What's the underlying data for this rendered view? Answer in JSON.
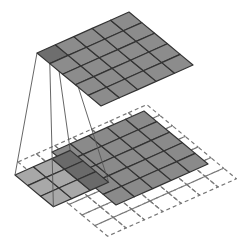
{
  "diagram": {
    "type": "convolution-illustration",
    "colors": {
      "background": "#ffffff",
      "output_cell": "#8c8c8c",
      "output_highlight": "#6e6e6e",
      "input_cell": "#8a8a8a",
      "kernel_cell": "#a8a8a8",
      "overlap_cell": "#6a6a6a",
      "grid_line": "#333333",
      "dashed_line": "#777777",
      "projection_line": "#555555"
    },
    "output_grid": {
      "rows": 5,
      "cols": 5,
      "origin": [
        37,
        53
      ],
      "col_step": [
        18.4,
        -8.2
      ],
      "row_step": [
        12.8,
        10.6
      ],
      "highlight_cell": [
        0,
        0
      ]
    },
    "padded_grid": {
      "rows": 7,
      "cols": 7,
      "origin": [
        18,
        162
      ],
      "col_step": [
        18.4,
        -8.2
      ],
      "row_step": [
        12.8,
        10.6
      ],
      "style": "dashed"
    },
    "input_grid": {
      "rows": 5,
      "cols": 5,
      "origin": [
        52,
        152
      ],
      "col_step": [
        18.4,
        -8.2
      ],
      "row_step": [
        12.8,
        10.6
      ]
    },
    "kernel_grid": {
      "rows": 3,
      "cols": 3,
      "origin": [
        15,
        175
      ],
      "col_step": [
        18.4,
        -8.2
      ],
      "row_step": [
        12.8,
        10.6
      ]
    }
  }
}
